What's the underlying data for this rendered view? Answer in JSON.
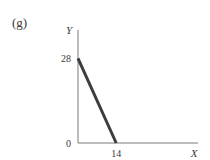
{
  "chart_data": {
    "type": "line",
    "panel_label": "(g)",
    "title": "",
    "xlabel": "X",
    "ylabel": "Y",
    "xlim": [
      0,
      44
    ],
    "ylim": [
      0,
      40
    ],
    "grid": false,
    "x_ticks": [
      {
        "value": 14,
        "label": "14"
      }
    ],
    "y_ticks": [
      {
        "value": 0,
        "label": "0"
      },
      {
        "value": 28,
        "label": "28"
      }
    ],
    "series": [
      {
        "name": "budget line",
        "x": [
          0,
          14
        ],
        "y": [
          28,
          0
        ],
        "color": "#3d3d3d"
      }
    ],
    "axis_color": "#7a7a7a"
  }
}
